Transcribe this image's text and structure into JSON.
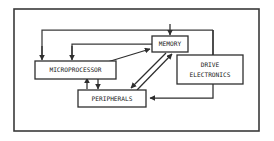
{
  "figure": {
    "background_color": "#ffffff",
    "line_color": "#3a3a3a",
    "text_color": "#1a1a1a",
    "frame": {
      "name": "outer-frame",
      "x": 14,
      "y": 9,
      "width": 245,
      "height": 122,
      "stroke_width": 1.6
    }
  },
  "blocks": [
    {
      "id": "microprocessor",
      "label": "MICROPROCESSOR",
      "lines": [
        "MICROPROCESSOR"
      ],
      "x": 35,
      "y": 61,
      "width": 81,
      "height": 18,
      "font_size": 6.2
    },
    {
      "id": "memory",
      "label": "MEMORY",
      "lines": [
        "MEMORY"
      ],
      "x": 152,
      "y": 36,
      "width": 36,
      "height": 16,
      "font_size": 6.2
    },
    {
      "id": "peripherals",
      "label": "PERIPHERALS",
      "lines": [
        "PERIPHERALS"
      ],
      "x": 78,
      "y": 90,
      "width": 68,
      "height": 17,
      "font_size": 6.2
    },
    {
      "id": "drive-electronics",
      "label": "DRIVE ELECTRONICS",
      "lines": [
        "DRIVE",
        "ELECTRONICS"
      ],
      "x": 177,
      "y": 55,
      "width": 66,
      "height": 29,
      "font_size": 6.2
    }
  ],
  "connections": [
    {
      "id": "memory-bus-to-microprocessor-upper",
      "from": "memory-top",
      "to": "microprocessor-top",
      "description": "Upper bus: left rail down into MICROPROCESSOR top-left",
      "arrow": "down"
    },
    {
      "id": "memory-bus-to-microprocessor-lower",
      "from": "memory-left",
      "to": "microprocessor-top",
      "description": "Lower bus: rail down into MICROPROCESSOR top-right",
      "arrow": "down"
    },
    {
      "id": "bus-to-memory-top",
      "from": "top-bus",
      "to": "memory-top",
      "description": "Top bus down-arrow into MEMORY top",
      "arrow": "down"
    },
    {
      "id": "bus-to-drive-electronics",
      "from": "top-bus-right",
      "to": "drive-electronics-top",
      "description": "Right rail down into DRIVE ELECTRONICS top",
      "arrow": "none"
    },
    {
      "id": "microprocessor-to-memory",
      "from": "microprocessor-right",
      "to": "memory-left",
      "description": "Diagonal from MICROPROCESSOR right edge up to MEMORY left",
      "arrow": "up-right"
    },
    {
      "id": "memory-to-peripherals",
      "from": "memory-bottom",
      "to": "peripherals-top",
      "description": "Diagonal down-left from MEMORY to PERIPHERALS",
      "arrow": "down-left"
    },
    {
      "id": "peripherals-to-memory",
      "from": "peripherals-top",
      "to": "memory-bottom",
      "description": "Diagonal up-right from PERIPHERALS to MEMORY",
      "arrow": "up-right"
    },
    {
      "id": "microprocessor-peripherals-up",
      "from": "peripherals-top",
      "to": "microprocessor-bottom",
      "description": "Short vertical link, arrow up into MICROPROCESSOR",
      "arrow": "up"
    },
    {
      "id": "microprocessor-peripherals-down",
      "from": "microprocessor-bottom",
      "to": "peripherals-top",
      "description": "Short vertical link, arrow down into PERIPHERALS",
      "arrow": "down"
    },
    {
      "id": "drive-electronics-to-peripherals",
      "from": "drive-electronics-bottom",
      "to": "peripherals-right",
      "description": "Down then left into PERIPHERALS right edge",
      "arrow": "left"
    }
  ]
}
